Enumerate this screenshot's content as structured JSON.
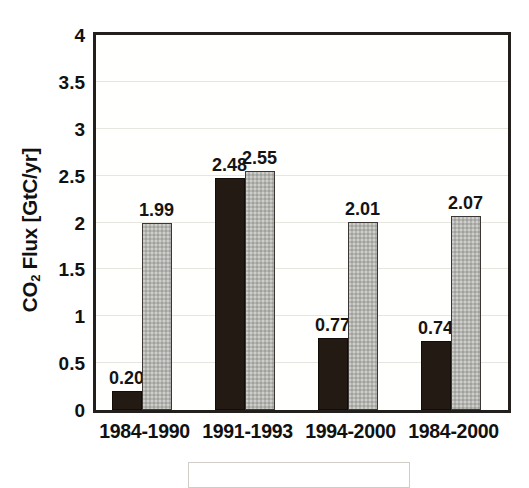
{
  "chart_data": {
    "type": "bar",
    "title": "",
    "xlabel": "",
    "ylabel": "CO2 Flux [GtC/yr]",
    "ylabel_parts": {
      "pre": "CO",
      "sub": "2",
      "post": " Flux [GtC/yr]"
    },
    "categories": [
      "1984-1990",
      "1991-1993",
      "1994-2000",
      "1984-2000"
    ],
    "series": [
      {
        "name": "black-series",
        "color": "#231a14",
        "values": [
          0.2,
          2.48,
          0.77,
          0.74
        ],
        "labels": [
          "0.20",
          "2.48",
          "0.77",
          "0.74"
        ]
      },
      {
        "name": "gray-series",
        "color": "#b4b4b0",
        "values": [
          1.99,
          2.55,
          2.01,
          2.07
        ],
        "labels": [
          "1.99",
          "2.55",
          "2.01",
          "2.07"
        ]
      }
    ],
    "ylim": [
      0,
      4
    ],
    "yticks": [
      0,
      0.5,
      1,
      1.5,
      2,
      2.5,
      3,
      3.5,
      4
    ],
    "ytick_labels": [
      "0",
      "0.5",
      "1",
      "1.5",
      "2",
      "2.5",
      "3",
      "3.5",
      "4"
    ],
    "grid": true,
    "grid_axis": "y",
    "legend": "cut-off",
    "legend_position": "below-axis",
    "frame_color": "#231f1c",
    "grid_color": "#e6e5df",
    "background": "#ffffff"
  }
}
